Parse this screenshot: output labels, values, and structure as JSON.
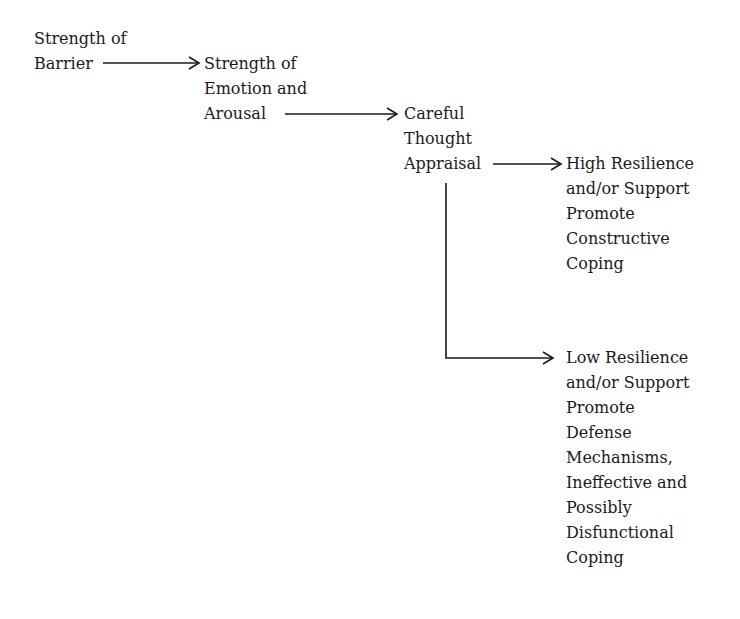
{
  "diagram": {
    "type": "flowchart",
    "nodes": [
      {
        "id": "barrier",
        "lines": [
          "Strength of",
          "Barrier"
        ]
      },
      {
        "id": "emotion",
        "lines": [
          "Strength of",
          "Emotion and",
          "Arousal"
        ]
      },
      {
        "id": "appraisal",
        "lines": [
          "Careful",
          "Thought",
          "Appraisal"
        ]
      },
      {
        "id": "high",
        "lines": [
          "High Resilience",
          "and/or Support",
          "Promote",
          "Constructive",
          "Coping"
        ]
      },
      {
        "id": "low",
        "lines": [
          "Low Resilience",
          "and/or Support",
          "Promote",
          "Defense",
          "Mechanisms,",
          "Ineffective and",
          "Possibly",
          "Disfunctional",
          "Coping"
        ]
      }
    ],
    "edges": [
      {
        "from": "barrier",
        "to": "emotion"
      },
      {
        "from": "emotion",
        "to": "appraisal"
      },
      {
        "from": "appraisal",
        "to": "high"
      },
      {
        "from": "appraisal",
        "to": "low"
      }
    ],
    "line_color": "#1a1a1a"
  }
}
